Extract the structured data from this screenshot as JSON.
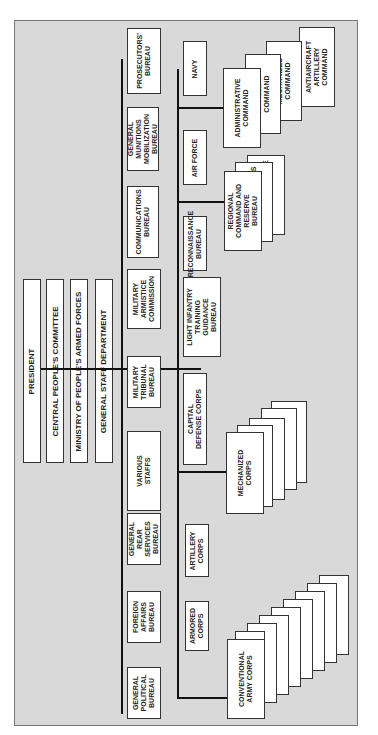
{
  "header": {
    "text": ""
  },
  "chart": {
    "top": [
      "PRESIDENT",
      "CENTRAL PEOPLE'S COMMITTEE",
      "MINISTRY OF PEOPLE'S ARMED FORCES",
      "GENERAL STAFF DEPARTMENT"
    ],
    "bureaus": [
      "PROSECUTORS'\nBUREAU",
      "GENERAL\nMUNITIONS\nMOBILIZATION\nBUREAU",
      "COMMUNICATIONS\nBUREAU",
      "MILITARY\nARMISTICE\nCOMMISSION",
      "MILITARY\nTRIBUNAL\nBUREAU",
      "VARIOUS\nSTAFFS",
      "GENERAL\nREAR\nSERVICES\nBUREAU",
      "FOREIGN\nAFFAIRS\nBUREAU",
      "GENERAL\nPOLITICAL\nBUREAU"
    ],
    "forces": [
      "NAVY",
      "AIR FORCE",
      "RECONNAISSANCE\nBUREAU",
      "LIGHT INFANTRY\nTRAINING\nGUIDANCE\nBUREAU",
      "CAPITAL\nDEFENSE CORPS",
      "ARTILLERY\nCORPS",
      "ARMORED\nCORPS"
    ],
    "admin": [
      "ADMINISTRATIVE\nCOMMAND",
      "ARTILLERY\nCOMMAND",
      "MECHANIZED\nCOMMAND",
      "ANTIAIRCRAFT\nARTILLERY\nCOMMAND"
    ],
    "regional": [
      "REGIONAL\nCOMMAND AND\nRESERVE\nBUREAU",
      "RESERVE DIVISIONS",
      "GENERAL RESERVE"
    ],
    "mech": [
      "MECHANIZED\nCORPS",
      "9TH CORPS",
      "10TH CORPS",
      "425TH CORPS",
      "815TH CORPS"
    ],
    "conv": [
      "CONVENTIONAL\nARMY CORPS",
      "1ST CORPS",
      "2D CORPS",
      "3D CORPS",
      "4TH CORPS",
      "5TH CORPS",
      "6TH CORPS",
      "7TH CORPS",
      "8TH CORPS"
    ]
  }
}
